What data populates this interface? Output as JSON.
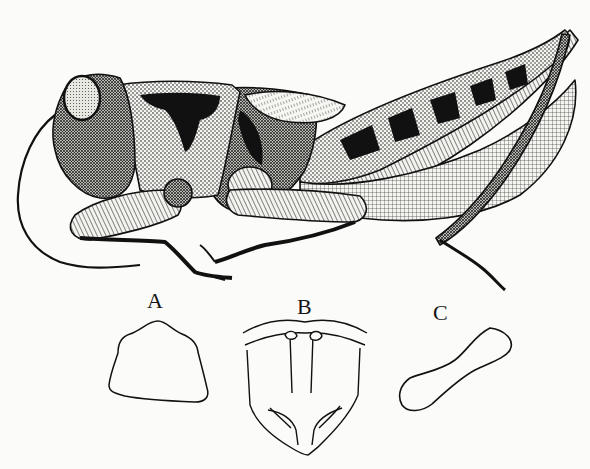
{
  "plate": {
    "subject": "grasshopper",
    "view": "lateral",
    "style": "pen-and-ink stipple illustration",
    "colors": {
      "ink": "#111111",
      "paper": "#fbfbf9"
    }
  },
  "figures": [
    {
      "id": "A",
      "label": "A",
      "description": "pronotum outline (dorsal view)"
    },
    {
      "id": "B",
      "label": "B",
      "description": "head / fastigium detail (frontal view)"
    },
    {
      "id": "C",
      "label": "C",
      "description": "tegmen / elongated lobe outline"
    }
  ]
}
